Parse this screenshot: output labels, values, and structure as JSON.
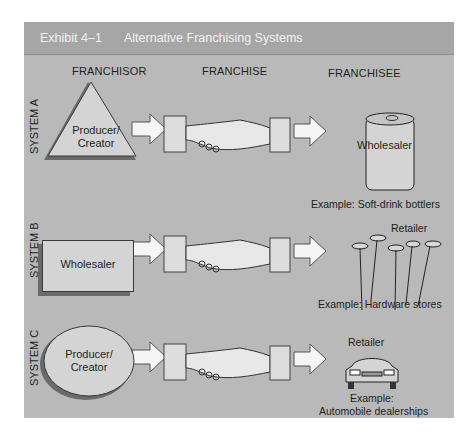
{
  "header": {
    "exhibit_number": "Exhibit 4–1",
    "title": "Alternative Franchising Systems"
  },
  "columns": {
    "franchisor": "FRANCHISOR",
    "franchise": "FRANCHISE",
    "franchisee": "FRANCHISEE"
  },
  "systems": [
    {
      "label": "SYSTEM A",
      "franchisor_shape": "triangle",
      "franchisor": "Producer/ Creator",
      "franchisee_icon": "soda-can-icon",
      "franchisee": "Wholesaler",
      "example": "Example: Soft-drink bottlers"
    },
    {
      "label": "SYSTEM B",
      "franchisor_shape": "rectangle",
      "franchisor": "Wholesaler",
      "franchisee_icon": "nails-icon",
      "franchisee": "Retailer",
      "example": "Example: Hardware stores"
    },
    {
      "label": "SYSTEM C",
      "franchisor_shape": "ellipse",
      "franchisor": "Producer/ Creator",
      "franchisee_icon": "car-icon",
      "franchisee": "Retailer",
      "example_line1": "Example:",
      "example_line2": "Automobile dealerships"
    }
  ],
  "colors": {
    "frame_bg": "#b9b9b9",
    "header_bg": "#a6a6a6",
    "shape_fill": "#d4d4d4",
    "shape_shadow": "#6a6a6a"
  }
}
